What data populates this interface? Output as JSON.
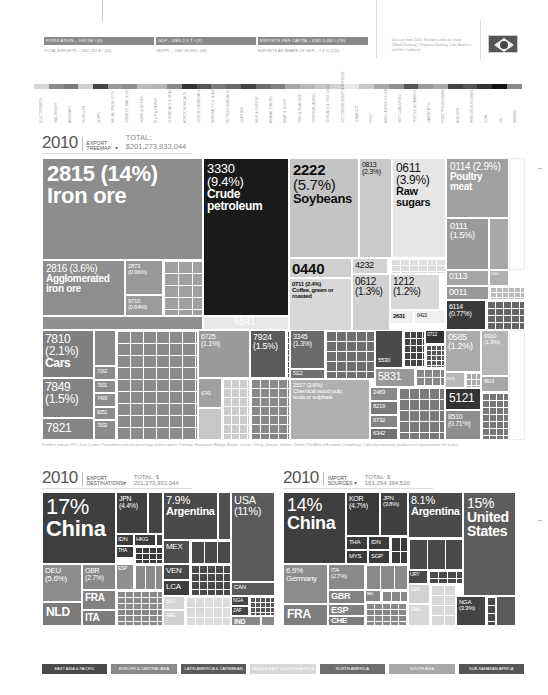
{
  "stats": [
    {
      "title": "POPULATION – 193.1M / (5)",
      "sub": "TOTAL EXPORTS – USD 201 B / (20)"
    },
    {
      "title": "GDP – USD 2.1 T / (7)",
      "sub": "GDPPC – USD 10,993 / (43)"
    },
    {
      "title": "EXPORTS PER CAPITA – USD 1,032 / (74)",
      "sub": "EXPORTS AS SHARE OF GDP – 9.4 % (120)"
    }
  ],
  "note": "Data are from 2010. Numbers indicate: Value (World Ranking) / Regional Ranking: Latin America and the Caribbean",
  "flag": "brazil-flag",
  "product_strip": {
    "colors": [
      "#d6d6d6",
      "#8a8a8a",
      "#7a7a7a",
      "#cfcfcf",
      "#444",
      "#9a9a9a",
      "#8e8e8e",
      "#bbbbbb",
      "#b5b5b5",
      "#8a8a8a",
      "#333",
      "#555",
      "#777",
      "#6a6a6a",
      "#444",
      "#6e6e6e",
      "#808080",
      "#a5a5a5",
      "#b8b8b8",
      "#c5c5c5",
      "#d2d2d2",
      "#e8e8e8",
      "#c8c8c8",
      "#aaaaaa",
      "#909090",
      "#555",
      "#9a9a9a",
      "#aaa",
      "#444",
      "#555",
      "#333",
      "#111",
      "#8a8a8a"
    ],
    "labels": [
      "ELECTRONICS",
      "MACHINERY",
      "AIRCRAFT",
      "VEHICLES",
      "SHIPS",
      "METAL PRODUCTS",
      "CONSTR. MAT. & EQPT.",
      "HOME & OFFICE",
      "PULP & PAPER",
      "CHEMICALS & HEALTH",
      "AGROCHEMICALS",
      "OTHER CHEMICALS",
      "NON-SALT CH. & ACIDS",
      "PETROCHEMICALS",
      "LEATHER",
      "MILK & CHEESE",
      "ANIMAL FIBERS",
      "MEAT & EGGS",
      "FISH & SEAFOOD",
      "TROPICAL AGRIC.",
      "CEREALS & VEG. OILS",
      "COTTON/RICE/SOY & OTHERS",
      "TOBACCO",
      "FRUIT",
      "MISC. AGRICULTURE",
      "NOT CLASSIFIED",
      "TEXTILE & FABRICS",
      "GARMENTS",
      "FOOD PROCESSING",
      "BOILERS",
      "PRECIOUS STONES",
      "COAL",
      "OIL",
      "MINING"
    ]
  },
  "export_treemap": {
    "year": "2010",
    "kind": "EXPORT TREEMAP",
    "total": "TOTAL: $201,273,933,044",
    "footnote": "Numbers indicate SITC 4 rev.2 codes. Parentheses indicate percentage of total exports. Treemap: Hausmann, Hidalgo, Bustos, Coscia, Chung, Jimenez, Simoes, Yildirim (The Atlas of Economic Complexity). Colors by community (products not represented to the scale)."
  },
  "chart_data": [
    {
      "type": "treemap",
      "title": "2010 EXPORT TREEMAP",
      "total": "$201,273,933,044",
      "items": [
        {
          "code": "2815",
          "pct": 14,
          "label": "Iron ore"
        },
        {
          "code": "3330",
          "pct": 9.4,
          "label": "Crude petroleum"
        },
        {
          "code": "2222",
          "pct": 5.7,
          "label": "Soybeans"
        },
        {
          "code": "0611",
          "pct": 3.9,
          "label": "Raw sugars"
        },
        {
          "code": "2816",
          "pct": 3.6,
          "label": "Agglomerated iron ore"
        },
        {
          "code": "0114",
          "pct": 2.9,
          "label": "Poultry meat"
        },
        {
          "code": "2517",
          "pct": 2.6,
          "label": "Chemical wood pulp, soda or sulphate"
        },
        {
          "code": "0711",
          "pct": 2.4,
          "label": "Coffee, green or roasted"
        },
        {
          "code": "0813",
          "pct": 2.3,
          "label": ""
        },
        {
          "code": "7810",
          "pct": 2.1,
          "label": "Cars"
        },
        {
          "code": "0111",
          "pct": 1.5,
          "label": ""
        },
        {
          "code": "7849",
          "pct": 1.5,
          "label": ""
        },
        {
          "code": "7924",
          "pct": 1.5,
          "label": ""
        },
        {
          "code": "0612",
          "pct": 1.3,
          "label": ""
        },
        {
          "code": "3345",
          "pct": 1.3,
          "label": ""
        },
        {
          "code": "9310",
          "pct": 1.3,
          "label": ""
        },
        {
          "code": "1212",
          "pct": 1.2,
          "label": ""
        },
        {
          "code": "0585",
          "pct": 1.2,
          "label": ""
        },
        {
          "code": "6725",
          "pct": 1.1,
          "label": ""
        },
        {
          "code": "2873",
          "pct": 0.96,
          "label": ""
        },
        {
          "code": "6114",
          "pct": 0.77,
          "label": ""
        },
        {
          "code": "8510",
          "pct": 0.71,
          "label": ""
        },
        {
          "code": "9710",
          "pct": 0.64,
          "label": ""
        },
        {
          "code": "0440",
          "pct": null,
          "label": ""
        },
        {
          "code": "4232",
          "pct": null,
          "label": ""
        },
        {
          "code": "2631",
          "pct": null,
          "label": ""
        },
        {
          "code": "0422",
          "pct": null,
          "label": ""
        },
        {
          "code": "0113",
          "pct": null,
          "label": ""
        },
        {
          "code": "0011",
          "pct": null,
          "label": ""
        },
        {
          "code": "6841",
          "pct": null,
          "label": ""
        },
        {
          "code": "7821",
          "pct": null,
          "label": ""
        },
        {
          "code": "5831",
          "pct": null,
          "label": ""
        },
        {
          "code": "5121",
          "pct": null,
          "label": ""
        }
      ]
    },
    {
      "type": "treemap",
      "title": "2010 EXPORT DESTINATIONS",
      "total": "$201,273,933,044",
      "items": [
        {
          "label": "China",
          "pct": 17
        },
        {
          "label": "USA",
          "pct": 11
        },
        {
          "label": "Argentina",
          "pct": 7.9
        },
        {
          "label": "DEU",
          "pct": 5.6
        },
        {
          "label": "JPN",
          "pct": 4.4
        },
        {
          "label": "GBR",
          "pct": 2.7
        },
        {
          "label": "NLD"
        },
        {
          "label": "FRA"
        },
        {
          "label": "ITA"
        },
        {
          "label": "ESP"
        },
        {
          "label": "IDN"
        },
        {
          "label": "HKG"
        },
        {
          "label": "THA"
        },
        {
          "label": "MEX"
        },
        {
          "label": "VEN"
        },
        {
          "label": "LCA"
        },
        {
          "label": "CAN"
        },
        {
          "label": "NGA"
        },
        {
          "label": "ZAF"
        },
        {
          "label": "IND"
        },
        {
          "label": "SAU"
        },
        {
          "label": "EGY"
        },
        {
          "label": "ARE"
        }
      ]
    },
    {
      "type": "treemap",
      "title": "2010 IMPORT SOURCES",
      "total": "$161,294,364,520",
      "items": [
        {
          "label": "United States",
          "pct": 15
        },
        {
          "label": "China",
          "pct": 14
        },
        {
          "label": "Argentina",
          "pct": 8.1
        },
        {
          "label": "Germany",
          "pct": 6.9
        },
        {
          "label": "KOR",
          "pct": 4.7
        },
        {
          "label": "JPN",
          "pct": 3.8
        },
        {
          "label": "NGA",
          "pct": 3.3
        },
        {
          "label": "ITA",
          "pct": 2.7
        },
        {
          "label": "FRA"
        },
        {
          "label": "GBR"
        },
        {
          "label": "ESP"
        },
        {
          "label": "CHE"
        },
        {
          "label": "THA"
        },
        {
          "label": "IDN"
        },
        {
          "label": "MYS"
        },
        {
          "label": "SGP"
        },
        {
          "label": "URY"
        },
        {
          "label": "DZA"
        },
        {
          "label": "SAU"
        },
        {
          "label": "BEL"
        }
      ]
    }
  ],
  "exp_dest": {
    "year": "2010",
    "kind": "EXPORT DESTINATIONS",
    "total": "TOTAL: $ 201,273,933,044"
  },
  "imp_src": {
    "year": "2010",
    "kind": "IMPORT SOURCES",
    "total": "TOTAL: $ 161,294,364,520"
  },
  "legend": [
    {
      "label": "EAST ASIA & PACIFIC",
      "color": "#4a4a4a"
    },
    {
      "label": "EUROPE & CENTRAL ASIA",
      "color": "#8a8a8a"
    },
    {
      "label": "LATIN AMERICA & CARIBBEAN",
      "color": "#5a5a5a"
    },
    {
      "label": "MIDDLE EAST & NORTH AFRICA",
      "color": "#d8d8d8"
    },
    {
      "label": "NORTH AMERICA",
      "color": "#6e6e6e"
    },
    {
      "label": "SOUTH ASIA",
      "color": "#a8a8a8"
    },
    {
      "label": "SUB-SAHARAN AFRICA",
      "color": "#555555"
    }
  ],
  "ex": {
    "iron": {
      "code": "2815 (14%)",
      "name": "Iron ore"
    },
    "crude": {
      "code": "3330",
      "pct": "(9.4%)",
      "n1": "Crude",
      "n2": "petroleum"
    },
    "soy": {
      "code": "2222",
      "pct": "(5.7%)",
      "name": "Soybeans"
    },
    "c0813": {
      "code": "0813",
      "pct": "(2.3%)"
    },
    "sugar": {
      "code": "0611",
      "pct": "(3.9%)",
      "n1": "Raw",
      "n2": "sugars"
    },
    "poultry": {
      "code": "0114 (2.9%)",
      "name": "Poultry meat"
    },
    "c0111": {
      "code": "0111",
      "pct": "(1.5%)"
    },
    "c0440": "0440",
    "c4232": "4232",
    "coffee": {
      "code": "0711 (2.4%)",
      "n1": "Coffee, green or",
      "n2": "roasted"
    },
    "c0612": {
      "code": "0612",
      "pct": "(1.3%)"
    },
    "c1212": {
      "code": "1212",
      "pct": "(1.2%)"
    },
    "c2631": "2631",
    "c0422": "0422",
    "c0113": "0113",
    "c0011": "0011",
    "c6114": {
      "code": "6114",
      "pct": "(0.77%)"
    },
    "aggl": {
      "code": "2816 (3.6%)",
      "n1": "Agglomerated",
      "n2": "iron ore"
    },
    "c2873": {
      "code": "2873",
      "pct": "(0.96%)"
    },
    "c9710": {
      "code": "9710",
      "pct": "(0.64%)"
    },
    "c6841": "6841",
    "cars": {
      "code": "7810",
      "pct": "(2.1%)",
      "name": "Cars"
    },
    "c7849": {
      "code": "7849",
      "pct": "(1.5%)"
    },
    "c7821": "7821",
    "c7162": "7162",
    "c7831": "7831",
    "c7493": "7493",
    "c8251": "8251",
    "c7832": "7832",
    "c6725": {
      "code": "6725",
      "pct": "(1.1%)"
    },
    "c6741": "6741",
    "c7924": {
      "code": "7924",
      "pct": "(1.5%)"
    },
    "c3345": {
      "code": "3345",
      "pct": "(1.3%)"
    },
    "c5112": "5112",
    "pulp": {
      "code": "2517 (2.6%)",
      "n1": "Chemical wood pulp,",
      "n2": "soda or sulphate"
    },
    "c5530": "5530",
    "c5831": "5831",
    "c2483": "2483",
    "c8219": "8219",
    "c6732": "6732",
    "c6342": "6342",
    "c0712": "0712",
    "c0585": {
      "code": "0585",
      "pct": "(1.2%)"
    },
    "c9310": {
      "code": "9310",
      "pct": "(1.3%)"
    },
    "c0576": "0576",
    "c6613": "6613",
    "c5121": "5121",
    "c8510": {
      "code": "8510",
      "pct": "(0.71%)"
    },
    "c0116": "0116"
  },
  "dest": {
    "china": {
      "pct": "17%",
      "name": "China"
    },
    "jpn": {
      "name": "JPN",
      "pct": "(4.4%)"
    },
    "arg": {
      "pct": "7.9%",
      "name": "Argentina"
    },
    "usa": {
      "name": "USA",
      "pct": "(11%)"
    },
    "idn": "IDN",
    "hkg": "HKG",
    "tha": "THA",
    "mex": "MEX",
    "ven": "VEN",
    "lca": "LCA",
    "deu": {
      "name": "DEU",
      "pct": "(5.6%)"
    },
    "gbr": {
      "name": "GBR",
      "pct": "(2.7%)"
    },
    "esp": "ESP",
    "fra": "FRA",
    "nld": "NLD",
    "ita": "ITA",
    "sau": "SAU",
    "egy": "EGY",
    "are": "ARE",
    "can": "CAN",
    "nga": "NGA",
    "zaf": "ZAF",
    "ind": "IND"
  },
  "imp": {
    "china": {
      "pct": "14%",
      "name": "China"
    },
    "kor": {
      "name": "KOR",
      "pct": "(4.7%)"
    },
    "jpn": {
      "name": "JPN",
      "pct": "(3.8%)"
    },
    "arg": {
      "pct": "8.1%",
      "name": "Argentina"
    },
    "usa": {
      "pct": "15%",
      "n1": "United",
      "n2": "States"
    },
    "tha": "THA",
    "idn": "IDN",
    "mys": "MYS",
    "sgp": "SGP",
    "deu": {
      "pct": "6.9%",
      "name": "Germany"
    },
    "ita": {
      "name": "ITA",
      "pct": "(2.7%)"
    },
    "gbr": "GBR",
    "esp": "ESP",
    "che": "CHE",
    "fra": "FRA",
    "bel": "BEL",
    "ury": "URY",
    "dza": "DZA",
    "sau": "SAU",
    "nga": {
      "name": "NGA",
      "pct": "(3.3%)"
    }
  }
}
